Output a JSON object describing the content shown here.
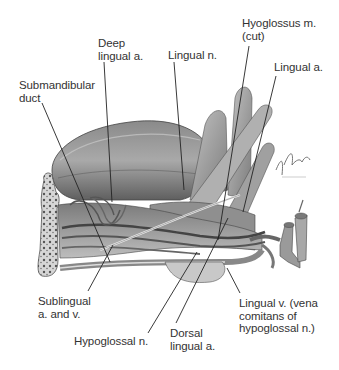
{
  "figure": {
    "signature": "F. Netter",
    "colors": {
      "background": "#ffffff",
      "label_text": "#333333",
      "leader_line": "#222222",
      "illustration_tone": "#6e6e6e"
    }
  },
  "labels": [
    {
      "id": "deep-lingual-a",
      "text": "Deep\nlingual a."
    },
    {
      "id": "lingual-n",
      "text": "Lingual n."
    },
    {
      "id": "hyoglossus-m",
      "text": "Hyoglossus m.\n(cut)"
    },
    {
      "id": "lingual-a",
      "text": "Lingual a."
    },
    {
      "id": "submandibular-duct",
      "text": "Submandibular\nduct"
    },
    {
      "id": "sublingual-a-v",
      "text": "Sublingual\na. and v."
    },
    {
      "id": "hypoglossal-n",
      "text": "Hypoglossal n."
    },
    {
      "id": "dorsal-lingual-a",
      "text": "Dorsal\nlingual a."
    },
    {
      "id": "lingual-v",
      "text": "Lingual v. (vena\ncomitans of\nhypoglossal n.)"
    }
  ]
}
